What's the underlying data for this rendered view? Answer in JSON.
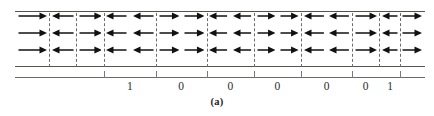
{
  "figure": {
    "caption": "(a)",
    "type": "magnetic-domain-strip",
    "colors": {
      "arrow": "#111111",
      "boundary": "#54544f",
      "domain_wall": "#6d6d68",
      "axis": "#6a6a64",
      "label_text": "#2b2b28",
      "background": "#ffffff"
    },
    "strip": {
      "rows": 3,
      "left_px": 15,
      "right_px": 425,
      "top_px": 11,
      "bottom_px": 67
    },
    "domains": [
      {
        "index": 0,
        "direction": "right",
        "arrows": 1,
        "start_pct": 0.0,
        "end_pct": 8.3
      },
      {
        "index": 1,
        "direction": "left",
        "arrows": 1,
        "start_pct": 8.3,
        "end_pct": 14.9
      },
      {
        "index": 2,
        "direction": "right",
        "arrows": 1,
        "start_pct": 14.9,
        "end_pct": 21.7
      },
      {
        "index": 3,
        "direction": "left",
        "arrows": 2,
        "start_pct": 21.7,
        "end_pct": 34.4
      },
      {
        "index": 4,
        "direction": "right",
        "arrows": 2,
        "start_pct": 34.4,
        "end_pct": 46.8
      },
      {
        "index": 5,
        "direction": "left",
        "arrows": 2,
        "start_pct": 46.8,
        "end_pct": 58.3
      },
      {
        "index": 6,
        "direction": "right",
        "arrows": 2,
        "start_pct": 58.3,
        "end_pct": 69.8
      },
      {
        "index": 7,
        "direction": "left",
        "arrows": 2,
        "start_pct": 69.8,
        "end_pct": 82.2
      },
      {
        "index": 8,
        "direction": "right",
        "arrows": 1,
        "start_pct": 82.2,
        "end_pct": 88.8
      },
      {
        "index": 9,
        "direction": "left",
        "arrows": 1,
        "start_pct": 88.8,
        "end_pct": 93.9
      },
      {
        "index": 10,
        "direction": "right",
        "arrows": 1,
        "start_pct": 93.9,
        "end_pct": 100.0
      }
    ],
    "domain_walls_pct": [
      8.3,
      14.9,
      21.7,
      34.4,
      46.8,
      58.3,
      69.8,
      82.2,
      88.8,
      93.9
    ],
    "axis_ticks_pct": [
      21.7,
      34.4,
      46.8,
      58.3,
      69.8,
      82.2,
      93.9
    ],
    "bit_labels": [
      {
        "value": "1",
        "position_pct": 28.0
      },
      {
        "value": "0",
        "position_pct": 40.5
      },
      {
        "value": "0",
        "position_pct": 52.5
      },
      {
        "value": "0",
        "position_pct": 64.0
      },
      {
        "value": "0",
        "position_pct": 76.0
      },
      {
        "value": "0",
        "position_pct": 85.5
      },
      {
        "value": "1",
        "position_pct": 91.5
      }
    ]
  }
}
